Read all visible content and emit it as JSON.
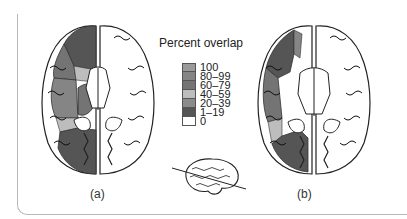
{
  "figure": {
    "legend": {
      "title": "Percent overlap",
      "items": [
        {
          "label": "100",
          "color": "#9a9a9a"
        },
        {
          "label": "80–99",
          "color": "#858585"
        },
        {
          "label": "60–79",
          "color": "#747474"
        },
        {
          "label": "40–59",
          "color": "#bdbdbd"
        },
        {
          "label": "20–39",
          "color": "#8c8c8c"
        },
        {
          "label": "1–19",
          "color": "#555555"
        },
        {
          "label": "0",
          "color": "#ffffff"
        }
      ]
    },
    "panels": [
      {
        "label": "(a)"
      },
      {
        "label": "(b)"
      }
    ]
  }
}
